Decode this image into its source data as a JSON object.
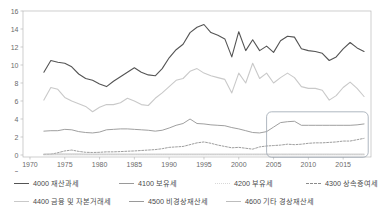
{
  "chart_data": {
    "type": "line",
    "title": "",
    "xlabel": "",
    "ylabel": "",
    "xlim": [
      1969,
      2019
    ],
    "ylim": [
      -2,
      16
    ],
    "yticks": [
      -2,
      0,
      2,
      4,
      6,
      8,
      10,
      12,
      14,
      16
    ],
    "xticks": [
      1970,
      1975,
      1980,
      1985,
      1990,
      1995,
      2000,
      2005,
      2010,
      2015
    ],
    "grid": false,
    "legend_position": "bottom",
    "annotations": [
      {
        "type": "rounded-rect-highlight",
        "x_range": [
          2004,
          2018.6
        ],
        "y_range": [
          -0.25,
          4.8
        ]
      }
    ],
    "x": [
      1972,
      1973,
      1974,
      1975,
      1976,
      1977,
      1978,
      1979,
      1980,
      1981,
      1982,
      1983,
      1984,
      1985,
      1986,
      1987,
      1988,
      1989,
      1990,
      1991,
      1992,
      1993,
      1994,
      1995,
      1996,
      1997,
      1998,
      1999,
      2000,
      2001,
      2002,
      2003,
      2004,
      2005,
      2006,
      2007,
      2008,
      2009,
      2010,
      2011,
      2012,
      2013,
      2014,
      2015,
      2016,
      2017,
      2018
    ],
    "series": [
      {
        "name": "4000 재산과세",
        "code": "4000",
        "label": "4000 재산과세",
        "color": "#545454",
        "style": "solid",
        "width": 1.1,
        "values": [
          9.2,
          10.5,
          10.3,
          10.2,
          9.8,
          9.0,
          8.5,
          8.3,
          7.9,
          7.6,
          8.2,
          8.7,
          9.2,
          9.7,
          9.2,
          8.9,
          8.8,
          9.6,
          10.8,
          11.7,
          12.3,
          13.6,
          14.2,
          14.5,
          13.6,
          13.3,
          12.9,
          10.9,
          13.7,
          11.6,
          12.8,
          11.6,
          12.1,
          11.4,
          12.7,
          13.2,
          13.1,
          11.8,
          11.6,
          11.5,
          11.3,
          10.5,
          10.9,
          11.8,
          12.5,
          11.9,
          11.5
        ]
      },
      {
        "name": "4100 보유세",
        "code": "4100",
        "label": "4100 보유세",
        "color": "#c9c9c9",
        "style": "solid",
        "width": 1.1,
        "values": [
          6.1,
          7.5,
          7.3,
          6.4,
          6.0,
          5.7,
          5.4,
          4.8,
          5.3,
          5.6,
          5.6,
          5.8,
          6.3,
          6.0,
          5.6,
          5.5,
          6.3,
          6.9,
          7.6,
          8.3,
          8.5,
          9.3,
          9.6,
          9.1,
          8.8,
          8.6,
          8.4,
          6.9,
          9.1,
          8.0,
          10.2,
          8.5,
          9.1,
          8.0,
          8.6,
          9.1,
          8.6,
          7.6,
          7.4,
          7.4,
          7.2,
          6.1,
          6.6,
          7.5,
          8.1,
          7.4,
          6.5
        ]
      },
      {
        "name": "4200 부유세",
        "code": "4200",
        "label": "4200 부유세",
        "color": "#dcdcdc",
        "style": "dotted",
        "width": 0.9,
        "values": [
          0.05,
          0.05,
          0.05,
          0.05,
          0.05,
          0.05,
          0.05,
          0.05,
          0.05,
          0.05,
          0.05,
          0.05,
          0.05,
          0.05,
          0.05,
          0.05,
          0.05,
          0.05,
          0.05,
          0.05,
          0.05,
          0.05,
          0.05,
          0.05,
          0.05,
          0.05,
          0.05,
          0.05,
          0.05,
          0.05,
          0.05,
          0.05,
          0.05,
          0.05,
          0.05,
          0.05,
          0.05,
          0.05,
          0.05,
          0.05,
          0.05,
          0.05,
          0.05,
          0.05,
          0.05,
          0.05,
          0.05
        ]
      },
      {
        "name": "4300 상속증여세",
        "code": "4300",
        "label": "4300 상속증여세",
        "color": "#8b8b8b",
        "style": "dashed",
        "width": 0.85,
        "values": [
          0.05,
          0.08,
          0.25,
          0.45,
          0.55,
          0.4,
          0.3,
          0.28,
          0.3,
          0.35,
          0.35,
          0.38,
          0.42,
          0.45,
          0.5,
          0.55,
          0.6,
          0.7,
          0.85,
          0.9,
          0.95,
          1.15,
          1.35,
          1.45,
          1.3,
          1.1,
          0.95,
          0.8,
          0.85,
          0.75,
          0.65,
          0.9,
          1.0,
          1.05,
          1.1,
          1.2,
          1.15,
          1.2,
          1.3,
          1.35,
          1.35,
          1.4,
          1.45,
          1.55,
          1.55,
          1.7,
          1.85
        ]
      },
      {
        "name": "4400 금융 및 자본거래세",
        "code": "4400",
        "label": "4400 금융 및 자본거래세",
        "color": "#9a9a9a",
        "style": "solid",
        "width": 0.95,
        "values": [
          2.65,
          2.7,
          2.7,
          2.85,
          2.8,
          2.6,
          2.5,
          2.45,
          2.55,
          2.8,
          2.85,
          2.9,
          2.9,
          2.85,
          2.8,
          2.75,
          2.65,
          2.75,
          3.0,
          3.3,
          3.5,
          4.0,
          3.5,
          3.45,
          3.35,
          3.3,
          3.25,
          3.05,
          2.9,
          2.7,
          2.5,
          2.45,
          2.6,
          3.1,
          3.6,
          3.7,
          3.75,
          3.3,
          3.3,
          3.3,
          3.3,
          3.3,
          3.3,
          3.3,
          3.3,
          3.35,
          3.45
        ]
      },
      {
        "name": "4500 비경상재산세",
        "code": "4500",
        "label": "4500 비경상재산세",
        "color": "#bdbdbd",
        "style": "solid",
        "width": 0.8,
        "values": [
          0.12,
          0.12,
          0.12,
          0.12,
          0.12,
          0.12,
          0.1,
          0.1,
          0.1,
          0.1,
          0.1,
          0.1,
          0.1,
          0.1,
          0.1,
          0.1,
          0.1,
          0.1,
          0.1,
          0.1,
          0.1,
          0.1,
          0.1,
          0.1,
          0.1,
          0.1,
          0.1,
          0.1,
          0.1,
          0.1,
          0.1,
          0.1,
          0.1,
          0.1,
          0.1,
          0.1,
          0.1,
          0.1,
          0.1,
          0.1,
          0.1,
          0.1,
          0.1,
          0.1,
          0.1,
          0.1,
          0.1
        ]
      },
      {
        "name": "4600 기타 경상재산세",
        "code": "4600",
        "label": "4600 기타 경상재산세",
        "color": "#d0d0d0",
        "style": "solid",
        "width": 0.8,
        "values": [
          0.02,
          0.02,
          0.02,
          0.02,
          0.02,
          0.02,
          0.02,
          0.02,
          0.02,
          0.02,
          0.02,
          0.02,
          0.02,
          0.02,
          0.02,
          0.02,
          0.02,
          0.02,
          0.02,
          0.02,
          0.02,
          0.02,
          0.02,
          0.02,
          0.02,
          0.02,
          0.02,
          0.02,
          0.02,
          0.02,
          0.02,
          0.02,
          0.02,
          0.02,
          0.02,
          0.02,
          0.02,
          0.02,
          0.02,
          0.02,
          0.02,
          0.02,
          0.02,
          0.02,
          0.02,
          0.02,
          0.02
        ]
      }
    ]
  },
  "legend": {
    "rows": [
      [
        {
          "label": "4000 재산과세",
          "color": "#545454",
          "style": "solid"
        },
        {
          "label": "4100 보유세",
          "color": "#9a9a9a",
          "style": "solid"
        },
        {
          "label": "4200 부유세",
          "color": "#d8d8d8",
          "style": "dotted"
        },
        {
          "label": "4300 상속증여세",
          "color": "#8b8b8b",
          "style": "dashed"
        }
      ],
      [
        {
          "label": "4400 금융 및 자본거래세",
          "color": "#c9c9c9",
          "style": "solid"
        },
        {
          "label": "4500 비경상재산세",
          "color": "#9a9a9a",
          "style": "solid"
        },
        {
          "label": "4600 기타 경상재산세",
          "color": "#bdbdbd",
          "style": "solid"
        }
      ]
    ]
  }
}
